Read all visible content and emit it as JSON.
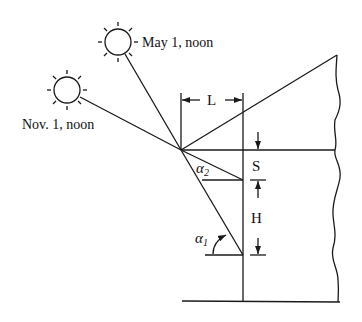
{
  "diagram": {
    "colors": {
      "line": "#1a1a1a",
      "background": "#ffffff"
    },
    "suns": [
      {
        "id": "may",
        "label": "May 1, noon",
        "icon": "sun-icon"
      },
      {
        "id": "nov",
        "label": "Nov. 1, noon",
        "icon": "sun-icon"
      }
    ],
    "dimensions": {
      "overhang_length": "L",
      "shade_offset": "S",
      "window_height": "H"
    },
    "angles": {
      "alpha1": "α",
      "alpha1_sub": "1",
      "alpha2": "α",
      "alpha2_sub": "2"
    }
  }
}
